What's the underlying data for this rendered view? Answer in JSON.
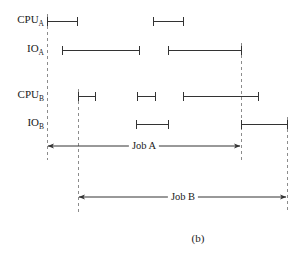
{
  "figure": {
    "caption": "(b)",
    "caption_x": 198,
    "caption_y": 238,
    "width": 305,
    "height": 256,
    "background_color": "#ffffff",
    "line_color": "#333333",
    "dash_color": "#8c8c8c"
  },
  "rows": [
    {
      "key": "cpu_a",
      "label_main": "CPU",
      "label_sub": "A",
      "label_x": 44,
      "y": 21,
      "segments": [
        {
          "start": 47,
          "end": 77
        },
        {
          "start": 153,
          "end": 183
        }
      ]
    },
    {
      "key": "io_a",
      "label_main": "IO",
      "label_sub": "A",
      "label_x": 44,
      "y": 50,
      "segments": [
        {
          "start": 62,
          "end": 139
        },
        {
          "start": 168,
          "end": 241
        }
      ]
    },
    {
      "key": "cpu_b",
      "label_main": "CPU",
      "label_sub": "B",
      "label_x": 44,
      "y": 96,
      "segments": [
        {
          "start": 78,
          "end": 95
        },
        {
          "start": 137,
          "end": 155
        },
        {
          "start": 183,
          "end": 258
        }
      ]
    },
    {
      "key": "io_b",
      "label_main": "IO",
      "label_sub": "B",
      "label_x": 44,
      "y": 124,
      "segments": [
        {
          "start": 136,
          "end": 168
        },
        {
          "start": 241,
          "end": 287
        }
      ]
    }
  ],
  "guides": [
    {
      "key": "job-a-start",
      "x": 47,
      "y1": 14,
      "y2": 160
    },
    {
      "key": "job-b-start",
      "x": 78,
      "y1": 89,
      "y2": 212
    },
    {
      "key": "job-a-end",
      "x": 241,
      "y1": 43,
      "y2": 160
    },
    {
      "key": "job-b-end",
      "x": 287,
      "y1": 117,
      "y2": 212
    }
  ],
  "spans": [
    {
      "key": "job-a",
      "label": "Job A",
      "start": 47,
      "end": 241,
      "y": 146,
      "label_x": 144
    },
    {
      "key": "job-b",
      "label": "Job B",
      "start": 78,
      "end": 287,
      "y": 197,
      "label_x": 183
    }
  ]
}
